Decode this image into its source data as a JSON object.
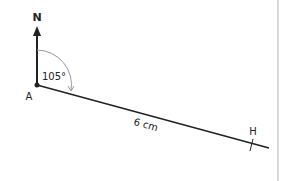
{
  "diagram": {
    "north_label": "N",
    "point_a_label": "A",
    "point_h_label": "H",
    "angle_label": "105°",
    "distance_label": "6 cm",
    "bearing_degrees": 105,
    "distance_cm": 6,
    "colors": {
      "line": "#222222",
      "arc": "#999999",
      "divider": "#d9d9d9"
    }
  }
}
